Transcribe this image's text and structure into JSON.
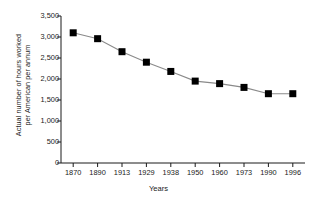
{
  "chart_data": {
    "type": "line",
    "title": "",
    "subtitle": "",
    "xlabel": "Years",
    "ylabel": "Actual number of hours worked per American per annum",
    "ylabel_line1": "Actual number of hours worked",
    "ylabel_line2": "per American per annum",
    "categories": [
      "1870",
      "1890",
      "1913",
      "1929",
      "1938",
      "1950",
      "1960",
      "1973",
      "1990",
      "1996"
    ],
    "values": [
      3100,
      2960,
      2650,
      2400,
      2180,
      1950,
      1890,
      1800,
      1650,
      1650
    ],
    "ylim": [
      0,
      3500
    ],
    "ytick_values": [
      0,
      500,
      1000,
      1500,
      2000,
      2500,
      3000,
      3500
    ],
    "ytick_labels": [
      "0",
      "500",
      "1,000",
      "1,500",
      "2,000",
      "2,500",
      "3,000",
      "3,500"
    ],
    "grid": false,
    "legend": null,
    "marker": "square",
    "marker_color": "#000000",
    "line_color": "#8a8a8a",
    "axis_color": "#1a1a1a",
    "background": "#ffffff"
  }
}
